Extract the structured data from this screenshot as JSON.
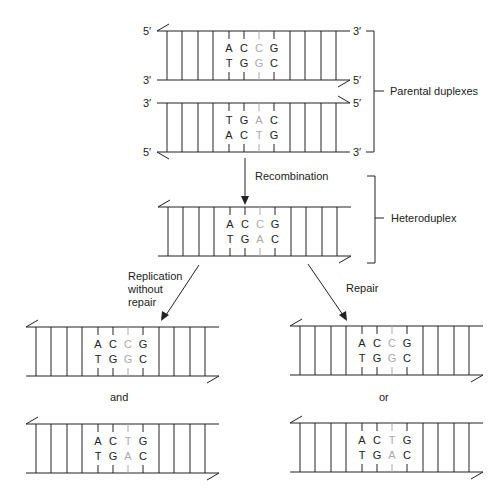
{
  "colors": {
    "ink": "#222222",
    "mismatch": "#aaaaaa",
    "background": "#ffffff"
  },
  "labels": {
    "parental": "Parental duplexes",
    "heteroduplex": "Heteroduplex",
    "recombination": "Recombination",
    "replication_line1": "Replication",
    "replication_line2": "without",
    "replication_line3": "repair",
    "repair": "Repair",
    "and": "and",
    "or": "or",
    "five_prime": "5′",
    "three_prime": "3′"
  },
  "duplexes": [
    {
      "id": "parental-1",
      "x": 157,
      "y": 31,
      "top": [
        "A",
        "C",
        "C",
        "G"
      ],
      "bottom": [
        "T",
        "G",
        "G",
        "C"
      ],
      "left_labels": [
        "5′",
        "3′"
      ],
      "right_labels": [
        "3′",
        "5′"
      ],
      "nick_top_left": true,
      "nick_bottom_right": true
    },
    {
      "id": "parental-2",
      "x": 157,
      "y": 103,
      "top": [
        "T",
        "G",
        "A",
        "C"
      ],
      "bottom": [
        "A",
        "C",
        "T",
        "G"
      ],
      "left_labels": [
        "3′",
        "5′"
      ],
      "right_labels": [
        "5′",
        "3′"
      ],
      "nick_top_right": true,
      "nick_bottom_left": true
    },
    {
      "id": "heteroduplex",
      "x": 158,
      "y": 207,
      "top": [
        "A",
        "C",
        "C",
        "G"
      ],
      "bottom": [
        "T",
        "G",
        "A",
        "C"
      ],
      "nick_top_left": true,
      "nick_bottom_right": true
    },
    {
      "id": "replication-product-1",
      "x": 26,
      "y": 327,
      "top": [
        "A",
        "C",
        "C",
        "G"
      ],
      "bottom": [
        "T",
        "G",
        "G",
        "C"
      ],
      "nick_top_left": true,
      "nick_bottom_right": true
    },
    {
      "id": "replication-product-2",
      "x": 26,
      "y": 424,
      "top": [
        "A",
        "C",
        "T",
        "G"
      ],
      "bottom": [
        "T",
        "G",
        "A",
        "C"
      ],
      "nick_top_left": true,
      "nick_bottom_right": true
    },
    {
      "id": "repair-product-1",
      "x": 290,
      "y": 326,
      "top": [
        "A",
        "C",
        "C",
        "G"
      ],
      "bottom": [
        "T",
        "G",
        "G",
        "C"
      ],
      "nick_top_left": true,
      "nick_bottom_right": true
    },
    {
      "id": "repair-product-2",
      "x": 290,
      "y": 423,
      "top": [
        "A",
        "C",
        "T",
        "G"
      ],
      "bottom": [
        "T",
        "G",
        "A",
        "C"
      ],
      "nick_top_left": true,
      "nick_bottom_right": true
    }
  ]
}
